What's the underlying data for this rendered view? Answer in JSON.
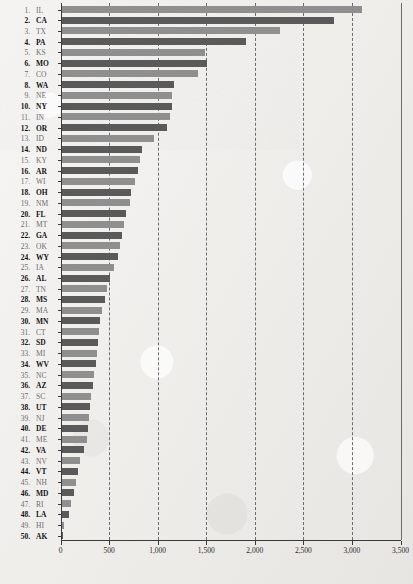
{
  "chart_data": {
    "type": "bar",
    "orientation": "horizontal",
    "title": "",
    "subtitle": "",
    "xlabel": "",
    "ylabel": "",
    "xlim": [
      0,
      3500
    ],
    "xticks": [
      0,
      500,
      1000,
      1500,
      2000,
      2500,
      3000,
      3500
    ],
    "xtick_labels": [
      "0",
      "500",
      "1,000",
      "1,500",
      "2,000",
      "2,500",
      "3,000",
      "3,500"
    ],
    "grid": "vertical-dashed",
    "legend": "none",
    "categories": [
      "IL",
      "CA",
      "TX",
      "PA",
      "KS",
      "MO",
      "CO",
      "WA",
      "NE",
      "NY",
      "IN",
      "OR",
      "ID",
      "ND",
      "KY",
      "AR",
      "WI",
      "OH",
      "NM",
      "FL",
      "MT",
      "GA",
      "OK",
      "WY",
      "IA",
      "AL",
      "TN",
      "MS",
      "MA",
      "MN",
      "CT",
      "SD",
      "MI",
      "WV",
      "NC",
      "AZ",
      "SC",
      "UT",
      "NJ",
      "DE",
      "ME",
      "VA",
      "NV",
      "VT",
      "NH",
      "MD",
      "RI",
      "LA",
      "HI",
      "AK"
    ],
    "ranks": [
      "1.",
      "2.",
      "3.",
      "4.",
      "5.",
      "6.",
      "7.",
      "8.",
      "9.",
      "10.",
      "11.",
      "12.",
      "13.",
      "14.",
      "15.",
      "16.",
      "17.",
      "18.",
      "19.",
      "20.",
      "21.",
      "22.",
      "23.",
      "24.",
      "25.",
      "26.",
      "27.",
      "28.",
      "29.",
      "30.",
      "31.",
      "32.",
      "33.",
      "34.",
      "35.",
      "36.",
      "37.",
      "38.",
      "39.",
      "40.",
      "41.",
      "42.",
      "43.",
      "44.",
      "45.",
      "46.",
      "47.",
      "48.",
      "49.",
      "50."
    ],
    "values": [
      3090,
      2810,
      2250,
      1900,
      1480,
      1500,
      1400,
      1160,
      1140,
      1140,
      1120,
      1090,
      950,
      830,
      810,
      790,
      760,
      720,
      700,
      660,
      640,
      620,
      600,
      580,
      540,
      500,
      470,
      450,
      420,
      400,
      390,
      380,
      370,
      355,
      330,
      320,
      300,
      290,
      280,
      270,
      260,
      230,
      190,
      170,
      150,
      130,
      95,
      75,
      30,
      20
    ],
    "bar_colors": [
      "#8f8f8f",
      "#5a5a5a"
    ]
  },
  "axis": {
    "x_min_label": "0",
    "x_max_label": "3,500"
  }
}
